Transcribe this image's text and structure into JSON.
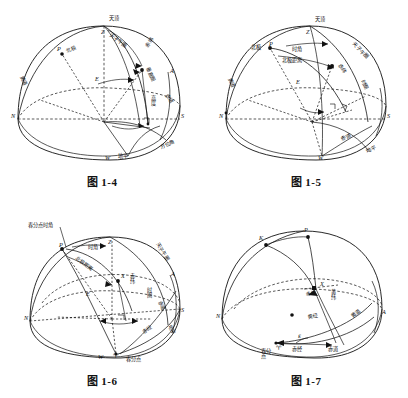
{
  "page": {
    "background": "#ffffff",
    "ink": "#111111",
    "width": 408,
    "height": 398
  },
  "figures": [
    {
      "id": "fig-1-4",
      "caption": "图 1-4",
      "topic": "地平坐标系",
      "points": [
        {
          "name": "zenith",
          "letter": "Z",
          "label": "天顶"
        },
        {
          "name": "pole",
          "letter": "P",
          "label": "北极"
        },
        {
          "name": "north",
          "letter": "N",
          "label": ""
        },
        {
          "name": "south",
          "letter": "S",
          "label": ""
        },
        {
          "name": "east",
          "letter": "E",
          "label": ""
        },
        {
          "name": "west",
          "letter": "W",
          "label": ""
        },
        {
          "name": "point-a",
          "letter": "A",
          "label": ""
        }
      ],
      "labels": [
        "天顶",
        "北极",
        "子午圈",
        "天子午圈",
        "大午圈",
        "赤道",
        "垂直圈",
        "高度",
        "地平",
        "方位角",
        "赤纬"
      ],
      "label_list": {
        "zenith": "天顶",
        "north_pole": "北极",
        "meridian": "天子午圈",
        "equator": "赤道",
        "vertical_circle": "垂直圈",
        "altitude": "高度",
        "horizon": "地平",
        "azimuth": "方位角",
        "declination": "赤纬",
        "left_arc": "黄道"
      }
    },
    {
      "id": "fig-1-5",
      "caption": "图 1-5",
      "topic": "第一赤道坐标系",
      "points": [
        {
          "name": "zenith",
          "letter": "Z",
          "label": "天顶"
        },
        {
          "name": "pole",
          "letter": "P",
          "label": "北极"
        },
        {
          "name": "north",
          "letter": "N",
          "label": ""
        },
        {
          "name": "south",
          "letter": "S",
          "label": ""
        },
        {
          "name": "east",
          "letter": "E",
          "label": ""
        },
        {
          "name": "west",
          "letter": "W",
          "label": ""
        }
      ],
      "label_list": {
        "zenith": "天顶",
        "north_pole": "北极",
        "hour_angle": "时角",
        "polar_distance": "北极距离",
        "meridian": "天子午圈",
        "declination": "赤纬",
        "hour_circle": "时圈",
        "equator": "赤道",
        "horizon": "地平",
        "left_arc": "黄道"
      }
    },
    {
      "id": "fig-1-6",
      "caption": "图 1-6",
      "topic": "第二赤道坐标系",
      "points": [
        {
          "name": "zenith",
          "letter": "Z",
          "label": ""
        },
        {
          "name": "pole",
          "letter": "P",
          "label": ""
        },
        {
          "name": "star",
          "letter": "X",
          "label": ""
        },
        {
          "name": "north",
          "letter": "N",
          "label": ""
        },
        {
          "name": "south",
          "letter": "S",
          "label": ""
        },
        {
          "name": "east",
          "letter": "E",
          "label": ""
        },
        {
          "name": "west",
          "letter": "W",
          "label": ""
        },
        {
          "name": "point-a",
          "letter": "A",
          "label": ""
        },
        {
          "name": "aries",
          "letter": "♈",
          "label": "春分点"
        }
      ],
      "label_list": {
        "equinox_hour_angle": "春分点时角",
        "hour_angle": "时角",
        "polar_distance": "北极距离",
        "meridian": "天子午圈",
        "declination": "赤纬",
        "hour_circle": "时圈",
        "equator": "赤道",
        "right_ascension": "赤经",
        "horizon": "地平",
        "vernal_equinox": "春分点"
      }
    },
    {
      "id": "fig-1-7",
      "caption": "图 1-7",
      "topic": "黄道坐标系",
      "points": [
        {
          "name": "ecliptic-pole",
          "letter": "K",
          "label": ""
        },
        {
          "name": "celestial-pole",
          "letter": "P",
          "label": ""
        },
        {
          "name": "star",
          "letter": "X",
          "label": ""
        },
        {
          "name": "north",
          "letter": "N",
          "label": ""
        },
        {
          "name": "point-a",
          "letter": "A",
          "label": ""
        },
        {
          "name": "aries",
          "letter": "♈",
          "label": "春分点"
        },
        {
          "name": "center",
          "letter": "",
          "label": ""
        }
      ],
      "label_list": {
        "declination": "赤纬",
        "ecliptic_latitude": "黄纬",
        "ecliptic_longitude": "黄经",
        "ecliptic": "黄道",
        "right_ascension": "赤经",
        "equator": "赤道",
        "vernal_equinox": "春分点",
        "obliquity_symbol": "ε"
      }
    }
  ]
}
